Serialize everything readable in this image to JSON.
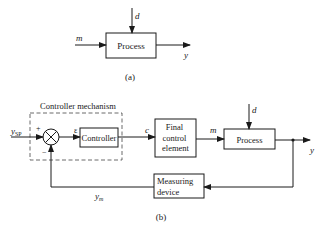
{
  "diagram_a": {
    "process_label": "Process",
    "input_label": "m",
    "disturbance_label": "d",
    "output_label": "y",
    "caption": "(a)"
  },
  "diagram_b": {
    "controller_mechanism_label": "Controller mechanism",
    "setpoint_label": "y",
    "setpoint_subscript": "SP",
    "plus_sign": "+",
    "minus_sign": "−",
    "error_label": "ε",
    "controller_label": "Controller",
    "controller_output_label": "c",
    "final_control_element_lines": [
      "Final",
      "control",
      "element"
    ],
    "manipulated_label": "m",
    "process_label": "Process",
    "disturbance_label": "d",
    "output_label": "y",
    "measuring_device_lines": [
      "Measuring",
      "device"
    ],
    "measured_label": "y",
    "measured_subscript": "m",
    "caption": "(b)"
  },
  "colors": {
    "line": "#1a1a1a",
    "background": "#ffffff"
  }
}
